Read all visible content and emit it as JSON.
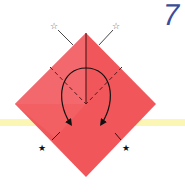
{
  "diagram": {
    "type": "origami-step",
    "step_number": "7",
    "paper_color": "#f0565a",
    "paper_color_light": "#f57a7c",
    "band_color": "#fbf6b4",
    "step_color": "#3a4d9a",
    "markers": {
      "top_left": "☆",
      "top_right": "☆",
      "bottom_left": "★",
      "bottom_right": "★"
    },
    "instructions": "Valley-fold both upper edges down along the dashed lines so the ☆ points meet the ★ points"
  }
}
